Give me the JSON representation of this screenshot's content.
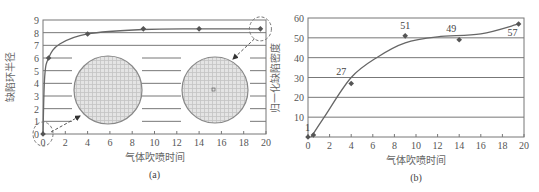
{
  "chart_data": [
    {
      "id": "a",
      "type": "line",
      "caption": "(a)",
      "xlabel": "气体吹喷时间",
      "ylabel": "缺陷环半径",
      "xlim": [
        0,
        20
      ],
      "ylim": [
        0,
        9
      ],
      "xticks": [
        "0",
        "2",
        "4",
        "6",
        "8",
        "10",
        "12",
        "14",
        "16",
        "18",
        "20"
      ],
      "yticks": [
        "0",
        "1",
        "2",
        "3",
        "4",
        "5",
        "6",
        "7",
        "8",
        "9"
      ],
      "grid": "horizontal",
      "series": [
        {
          "name": "缺陷环半径",
          "x": [
            0,
            0.5,
            4,
            9,
            14,
            19.5
          ],
          "y": [
            0,
            6,
            7.9,
            8.3,
            8.3,
            8.3
          ]
        }
      ],
      "insets": [
        {
          "name": "wafer-initial",
          "points_to_x": 0,
          "points_to_y": 0
        },
        {
          "name": "wafer-final",
          "points_to_x": 19.5,
          "points_to_y": 8.3
        }
      ]
    },
    {
      "id": "b",
      "type": "line",
      "caption": "(b)",
      "xlabel": "气体吹喷时间",
      "ylabel": "归一化缺陷密度",
      "xlim": [
        0,
        20
      ],
      "ylim": [
        0,
        60
      ],
      "xticks": [
        "0",
        "2",
        "4",
        "6",
        "8",
        "10",
        "12",
        "14",
        "16",
        "18",
        "20"
      ],
      "yticks": [
        "10",
        "20",
        "30",
        "40",
        "50",
        "60"
      ],
      "grid": "horizontal",
      "series": [
        {
          "name": "归一化缺陷密度",
          "x": [
            0,
            0.5,
            4,
            9,
            14,
            19.5
          ],
          "y": [
            0,
            1,
            27,
            51,
            49,
            57
          ]
        }
      ],
      "annotations": [
        "1",
        "27",
        "51",
        "49",
        "57"
      ]
    }
  ]
}
